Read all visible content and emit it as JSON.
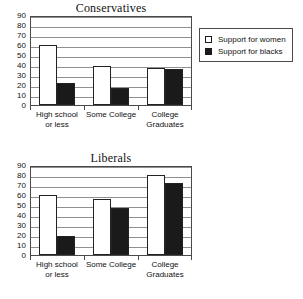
{
  "legend": {
    "entries": [
      {
        "label": "Support for women",
        "swatch": "white-square-icon",
        "color": "#ffffff"
      },
      {
        "label": "Support for blacks",
        "swatch": "black-square-icon",
        "color": "#1a1a1a"
      }
    ]
  },
  "charts": [
    {
      "title": "Conservatives",
      "yticks": [
        "0",
        "10",
        "20",
        "30",
        "40",
        "50",
        "60",
        "70",
        "80",
        "90"
      ],
      "categories": [
        "High school or less",
        "Some College",
        "College Graduates"
      ],
      "category_lines": [
        [
          "High school",
          "or less"
        ],
        [
          "Some College",
          ""
        ],
        [
          "College",
          "Graduates"
        ]
      ]
    },
    {
      "title": "Liberals",
      "yticks": [
        "0",
        "10",
        "20",
        "30",
        "40",
        "50",
        "60",
        "70",
        "80",
        "90"
      ],
      "categories": [
        "High school or less",
        "Some College",
        "College Graduates"
      ],
      "category_lines": [
        [
          "High school",
          "or less"
        ],
        [
          "Some College",
          ""
        ],
        [
          "College",
          "Graduates"
        ]
      ]
    }
  ],
  "chart_data": [
    {
      "type": "bar",
      "title": "Conservatives",
      "categories": [
        "High school or less",
        "Some College",
        "College Graduates"
      ],
      "series": [
        {
          "name": "Support for women",
          "values": [
            60,
            39,
            37
          ],
          "color": "#ffffff"
        },
        {
          "name": "Support for blacks",
          "values": [
            22,
            17,
            36
          ],
          "color": "#1a1a1a"
        }
      ],
      "xlabel": "",
      "ylabel": "",
      "ylim": [
        0,
        90
      ],
      "ytick_step": 10,
      "grid": true,
      "legend_position": "right"
    },
    {
      "type": "bar",
      "title": "Liberals",
      "categories": [
        "High school or less",
        "Some College",
        "College Graduates"
      ],
      "series": [
        {
          "name": "Support for women",
          "values": [
            60,
            56,
            80
          ],
          "color": "#ffffff"
        },
        {
          "name": "Support for blacks",
          "values": [
            19,
            47,
            72
          ],
          "color": "#1a1a1a"
        }
      ],
      "xlabel": "",
      "ylabel": "",
      "ylim": [
        0,
        90
      ],
      "ytick_step": 10,
      "grid": true,
      "legend_position": "none"
    }
  ]
}
